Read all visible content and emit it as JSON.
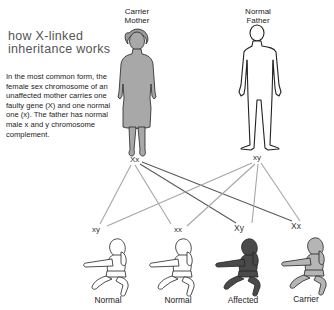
{
  "title": "how X-linked inheritance works",
  "description": "In the most common form, the female sex chromosome of an unaffected mother carries one faulty gene (X) and one normal one (x). The father has normal male x and y chromosome complement.",
  "parents": {
    "mother": {
      "label_line1": "Carrier",
      "label_line2": "Mother",
      "genotype": "Xx",
      "fill": "#a8a8a8"
    },
    "father": {
      "label_line1": "Normal",
      "label_line2": "Father",
      "genotype": "xy",
      "fill": "#ffffff"
    }
  },
  "children": [
    {
      "genotype": "xy",
      "label": "Normal",
      "fill": "#ffffff"
    },
    {
      "genotype": "xx",
      "label": "Normal",
      "fill": "#ffffff"
    },
    {
      "genotype": "Xy",
      "label": "Affected",
      "fill": "#4a4a4a"
    },
    {
      "genotype": "Xx",
      "label": "Carrier",
      "fill": "#b5b5b5"
    }
  ],
  "colors": {
    "normal_line": "#a6a6a6",
    "faulty_line": "#5a5a5a",
    "outline": "#222222"
  }
}
